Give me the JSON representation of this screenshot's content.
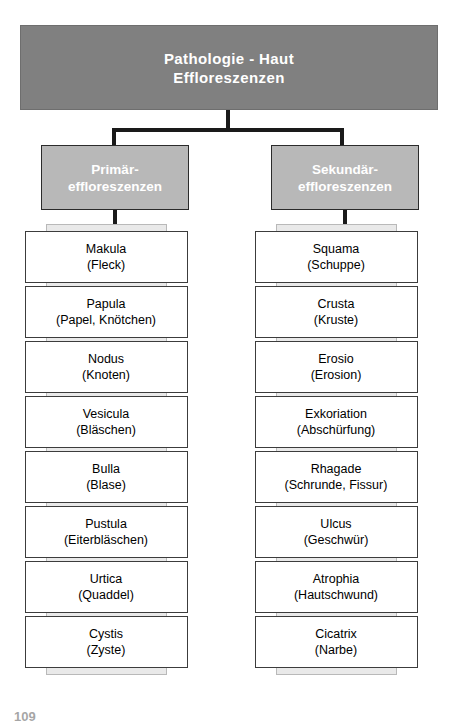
{
  "title": {
    "line1": "Pathologie - Haut",
    "line2": "Effloreszenzen"
  },
  "colors": {
    "title_fill": "#808080",
    "header_fill": "#b8b8b8",
    "tab_fill": "#e9e9e9",
    "box_fill": "#ffffff",
    "line": "#1a1a1a",
    "title_text": "#ffffff"
  },
  "columns": [
    {
      "id": "primary",
      "header_line1": "Primär-",
      "header_line2": "effloreszenzen",
      "items": [
        {
          "name": "Makula",
          "sub": "(Fleck)"
        },
        {
          "name": "Papula",
          "sub": "(Papel, Knötchen)"
        },
        {
          "name": "Nodus",
          "sub": "(Knoten)"
        },
        {
          "name": "Vesicula",
          "sub": "(Bläschen)"
        },
        {
          "name": "Bulla",
          "sub": "(Blase)"
        },
        {
          "name": "Pustula",
          "sub": "(Eiterbläschen)"
        },
        {
          "name": "Urtica",
          "sub": "(Quaddel)"
        },
        {
          "name": "Cystis",
          "sub": "(Zyste)"
        }
      ]
    },
    {
      "id": "secondary",
      "header_line1": "Sekundär-",
      "header_line2": "effloreszenzen",
      "items": [
        {
          "name": "Squama",
          "sub": "(Schuppe)"
        },
        {
          "name": "Crusta",
          "sub": "(Kruste)"
        },
        {
          "name": "Erosio",
          "sub": "(Erosion)"
        },
        {
          "name": "Exkoriation",
          "sub": "(Abschürfung)"
        },
        {
          "name": "Rhagade",
          "sub": "(Schrunde, Fissur)"
        },
        {
          "name": "Ulcus",
          "sub": "(Geschwür)"
        },
        {
          "name": "Atrophia",
          "sub": "(Hautschwund)"
        },
        {
          "name": "Cicatrix",
          "sub": "(Narbe)"
        }
      ]
    }
  ],
  "page_number": "109"
}
